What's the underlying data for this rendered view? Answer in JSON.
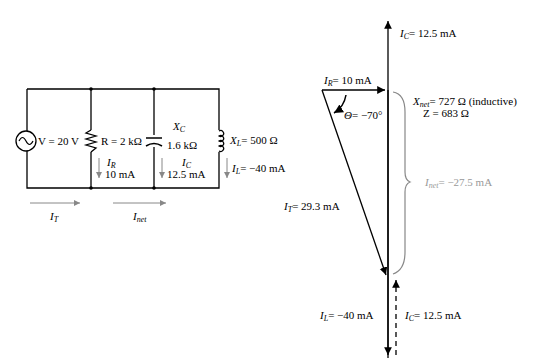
{
  "circuit": {
    "source": {
      "label": "V = 20 V"
    },
    "resistor": {
      "label": "R = 2 kΩ",
      "current_symbol": "I",
      "current_sub": "R",
      "current_value": "10 mA"
    },
    "capacitor": {
      "label_symbol": "X",
      "label_sub": "C",
      "label_value": "1.6 kΩ",
      "current_symbol": "I",
      "current_sub": "C",
      "current_value": "12.5 mA"
    },
    "inductor": {
      "label_symbol": "X",
      "label_sub": "L",
      "label_value": "= 500  Ω",
      "current_symbol": "I",
      "current_sub": "L",
      "current_value": "= −40 mA"
    },
    "total_current": {
      "symbol": "I",
      "sub": "T"
    },
    "net_current": {
      "symbol": "I",
      "sub": "net"
    }
  },
  "phasor": {
    "ic_top": {
      "symbol": "I",
      "sub": "C",
      "value": "= 12.5 mA"
    },
    "ir": {
      "symbol": "I",
      "sub": "R",
      "value": "= 10 mA"
    },
    "theta": {
      "symbol": "Θ",
      "value": "= −70°"
    },
    "xnet": {
      "symbol": "X",
      "sub": "net",
      "value": "= 727 Ω (inductive)"
    },
    "z": {
      "value": "Z = 683 Ω"
    },
    "inet": {
      "symbol": "I",
      "sub": "net",
      "value": "= −27.5 mA"
    },
    "it": {
      "symbol": "I",
      "sub": "T",
      "value": "= 29.3 mA"
    },
    "il": {
      "symbol": "I",
      "sub": "L",
      "value": "= −40 mA"
    },
    "ic_bottom": {
      "symbol": "I",
      "sub": "C",
      "value": "= 12.5 mA"
    }
  },
  "colors": {
    "line": "#000000",
    "gray": "#999999"
  }
}
